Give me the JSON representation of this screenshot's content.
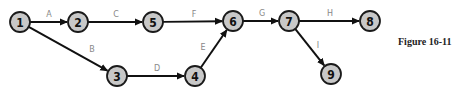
{
  "caption": "Figure 16-11",
  "nodes": [
    {
      "id": "1",
      "x": 20,
      "y": 22
    },
    {
      "id": "2",
      "x": 78,
      "y": 22
    },
    {
      "id": "5",
      "x": 153,
      "y": 22
    },
    {
      "id": "3",
      "x": 117,
      "y": 76
    },
    {
      "id": "4",
      "x": 195,
      "y": 76
    },
    {
      "id": "6",
      "x": 233,
      "y": 21
    },
    {
      "id": "7",
      "x": 289,
      "y": 21
    },
    {
      "id": "8",
      "x": 370,
      "y": 21
    },
    {
      "id": "9",
      "x": 331,
      "y": 74
    }
  ],
  "edges": [
    {
      "label": "A",
      "from": "1",
      "to": "2",
      "lx": 49,
      "ly": 17
    },
    {
      "label": "C",
      "from": "2",
      "to": "5",
      "lx": 116,
      "ly": 17
    },
    {
      "label": "B",
      "from": "1",
      "to": "3",
      "lx": 92,
      "ly": 52
    },
    {
      "label": "F",
      "from": "5",
      "to": "6",
      "lx": 194,
      "ly": 17
    },
    {
      "label": "D",
      "from": "3",
      "to": "4",
      "lx": 157,
      "ly": 71
    },
    {
      "label": "E",
      "from": "4",
      "to": "6",
      "lx": 203,
      "ly": 50
    },
    {
      "label": "G",
      "from": "6",
      "to": "7",
      "lx": 262,
      "ly": 16
    },
    {
      "label": "H",
      "from": "7",
      "to": "8",
      "lx": 330,
      "ly": 16
    },
    {
      "label": "I",
      "from": "7",
      "to": "9",
      "lx": 318,
      "ly": 48
    }
  ]
}
